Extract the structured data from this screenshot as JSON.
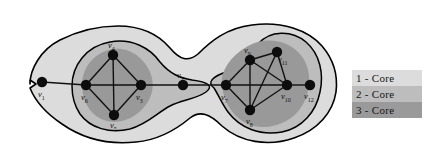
{
  "figure": {
    "background_color": "#ffffff",
    "node_color": "#0d0d0d",
    "edge_color": "#111111",
    "outline_color": "#000000",
    "regions": [
      {
        "name": "1-core-region",
        "fill": "#dcdcdc"
      },
      {
        "name": "2-core-region",
        "fill": "#bdbdbd"
      },
      {
        "name": "3-core-region",
        "fill": "#999999"
      }
    ]
  },
  "graph": {
    "nodes": [
      {
        "id": "v1",
        "label": "v",
        "sub": "1",
        "x": 42,
        "y": 82,
        "label_x": 38,
        "label_y": 97
      },
      {
        "id": "v2",
        "label": "v",
        "sub": "2",
        "x": 183,
        "y": 85,
        "label_x": 177,
        "label_y": 78
      },
      {
        "id": "v3",
        "label": "v",
        "sub": "3",
        "x": 141,
        "y": 85,
        "label_x": 136,
        "label_y": 100
      },
      {
        "id": "v4",
        "label": "v",
        "sub": "4",
        "x": 113,
        "y": 55,
        "label_x": 108,
        "label_y": 48
      },
      {
        "id": "v5",
        "label": "v",
        "sub": "5",
        "x": 114,
        "y": 115,
        "label_x": 110,
        "label_y": 128
      },
      {
        "id": "v6",
        "label": "v",
        "sub": "6",
        "x": 86,
        "y": 85,
        "label_x": 81,
        "label_y": 100
      },
      {
        "id": "v7",
        "label": "v",
        "sub": "7",
        "x": 226,
        "y": 85,
        "label_x": 221,
        "label_y": 100
      },
      {
        "id": "v8",
        "label": "v",
        "sub": "8",
        "x": 250,
        "y": 110,
        "label_x": 246,
        "label_y": 124
      },
      {
        "id": "v9",
        "label": "v",
        "sub": "9",
        "x": 250,
        "y": 60,
        "label_x": 244,
        "label_y": 53
      },
      {
        "id": "v10",
        "label": "v",
        "sub": "10",
        "x": 287,
        "y": 85,
        "label_x": 281,
        "label_y": 99
      },
      {
        "id": "v11",
        "label": "v",
        "sub": "11",
        "x": 277,
        "y": 52,
        "label_x": 278,
        "label_y": 62
      },
      {
        "id": "v12",
        "label": "v",
        "sub": "12",
        "x": 310,
        "y": 85,
        "label_x": 304,
        "label_y": 99
      }
    ],
    "edges": [
      {
        "from": "v1",
        "to": "v6"
      },
      {
        "from": "v6",
        "to": "v4"
      },
      {
        "from": "v6",
        "to": "v3"
      },
      {
        "from": "v6",
        "to": "v5"
      },
      {
        "from": "v4",
        "to": "v3"
      },
      {
        "from": "v4",
        "to": "v5"
      },
      {
        "from": "v3",
        "to": "v5"
      },
      {
        "from": "v3",
        "to": "v2"
      },
      {
        "from": "v2",
        "to": "v7"
      },
      {
        "from": "v7",
        "to": "v9"
      },
      {
        "from": "v7",
        "to": "v8"
      },
      {
        "from": "v7",
        "to": "v10"
      },
      {
        "from": "v9",
        "to": "v11"
      },
      {
        "from": "v9",
        "to": "v8"
      },
      {
        "from": "v9",
        "to": "v10"
      },
      {
        "from": "v11",
        "to": "v8"
      },
      {
        "from": "v11",
        "to": "v10"
      },
      {
        "from": "v8",
        "to": "v10"
      },
      {
        "from": "v10",
        "to": "v12"
      }
    ]
  },
  "legend": {
    "items": [
      {
        "label": "1 - Core",
        "color": "#dcdcdc"
      },
      {
        "label": "2 - Core",
        "color": "#bdbdbd"
      },
      {
        "label": "3 - Core",
        "color": "#9a9a9a"
      }
    ]
  }
}
